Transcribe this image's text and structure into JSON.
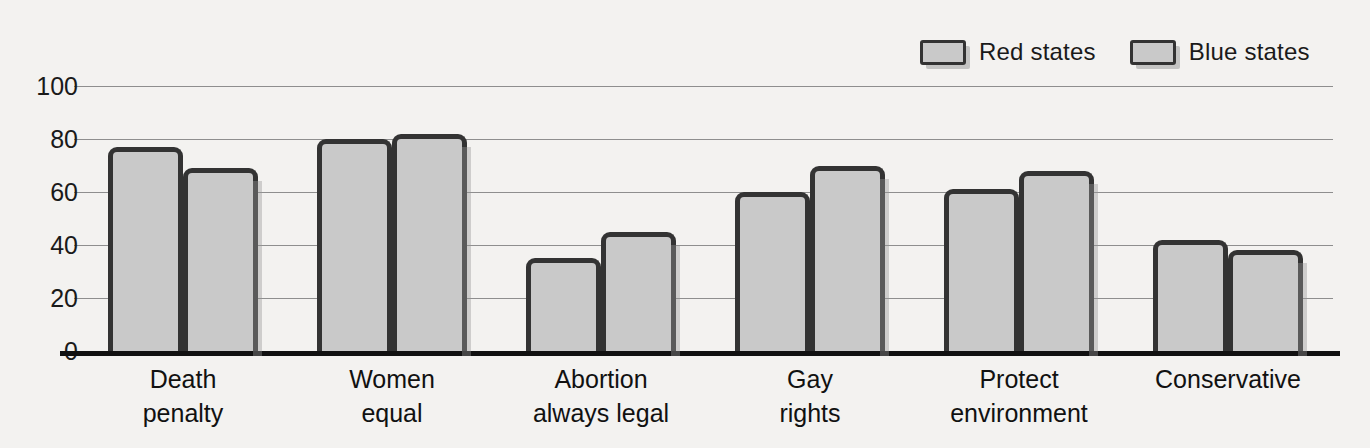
{
  "chart_data": {
    "type": "bar",
    "title": "",
    "subtitle": "",
    "xlabel": "",
    "ylabel": "",
    "ylim": [
      0,
      100
    ],
    "yticks": [
      0,
      20,
      40,
      60,
      80,
      100
    ],
    "ytick_labels": [
      "0",
      "20",
      "40",
      "60",
      "80",
      "100"
    ],
    "grid": true,
    "legend_position": "top-right",
    "categories": [
      "Death\npenalty",
      "Women\nequal",
      "Abortion\nalways legal",
      "Gay\nrights",
      "Protect\nenvironment",
      "Conservative"
    ],
    "series": [
      {
        "name": "Red states",
        "color": "#c9c9c9",
        "edge_color": "#333333",
        "values": [
          77,
          80,
          35,
          60,
          61,
          42
        ]
      },
      {
        "name": "Blue states",
        "color": "#c9c9c9",
        "edge_color": "#333333",
        "values": [
          69,
          82,
          45,
          70,
          68,
          38
        ]
      }
    ]
  },
  "legend": {
    "entries": [
      {
        "label": "Red states"
      },
      {
        "label": "Blue states"
      }
    ]
  },
  "axis": {
    "y_labels": [
      "100",
      "80",
      "60",
      "40",
      "20",
      "0"
    ]
  },
  "colors": {
    "background": "#f3f2f0",
    "bar_fill": "#c9c9c9",
    "bar_edge": "#333333",
    "gridline": "#8e8e8e",
    "axis": "#111111",
    "text": "#1a1a1a"
  }
}
